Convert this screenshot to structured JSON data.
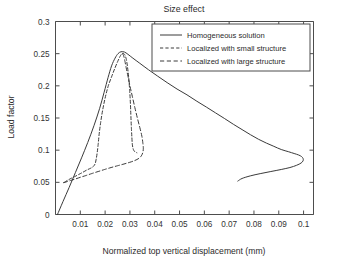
{
  "chart_data": {
    "type": "line",
    "title": "Size effect",
    "xlabel": "Normalized top vertical displacement (mm)",
    "ylabel": "Load factor",
    "xlim": [
      0,
      0.104
    ],
    "ylim": [
      0,
      0.3
    ],
    "grid": false,
    "legend_position": "upper-right-inside",
    "xticks": [
      0.01,
      0.02,
      0.03,
      0.04,
      0.05,
      0.06,
      0.07,
      0.08,
      0.09,
      0.1
    ],
    "xticklabels": [
      "0.01",
      "0.02",
      "0.03",
      "0.04",
      "0.05",
      "0.06",
      "0.07",
      "0.08",
      "0.09",
      "0.1"
    ],
    "yticks": [
      0,
      0.05,
      0.1,
      0.15,
      0.2,
      0.25,
      0.3
    ],
    "yticklabels": [
      "0",
      "0.05",
      "0.1",
      "0.15",
      "0.2",
      "0.25",
      "0.3"
    ],
    "series": [
      {
        "name": "Homogeneous solution",
        "style": "solid",
        "points": [
          [
            0.0008,
            0.0
          ],
          [
            0.003,
            0.02
          ],
          [
            0.0055,
            0.042
          ],
          [
            0.008,
            0.065
          ],
          [
            0.0105,
            0.088
          ],
          [
            0.013,
            0.112
          ],
          [
            0.0155,
            0.138
          ],
          [
            0.0178,
            0.165
          ],
          [
            0.0196,
            0.19
          ],
          [
            0.0212,
            0.213
          ],
          [
            0.0226,
            0.231
          ],
          [
            0.024,
            0.243
          ],
          [
            0.0252,
            0.25
          ],
          [
            0.0264,
            0.253
          ],
          [
            0.0278,
            0.2525
          ],
          [
            0.0292,
            0.249
          ],
          [
            0.0312,
            0.243
          ],
          [
            0.034,
            0.235
          ],
          [
            0.0375,
            0.225
          ],
          [
            0.0412,
            0.215
          ],
          [
            0.045,
            0.205
          ],
          [
            0.049,
            0.195
          ],
          [
            0.053,
            0.186
          ],
          [
            0.057,
            0.176
          ],
          [
            0.0608,
            0.167
          ],
          [
            0.0645,
            0.158
          ],
          [
            0.0682,
            0.149
          ],
          [
            0.0718,
            0.14
          ],
          [
            0.0752,
            0.132
          ],
          [
            0.0786,
            0.124
          ],
          [
            0.0818,
            0.117
          ],
          [
            0.085,
            0.111
          ],
          [
            0.088,
            0.106
          ],
          [
            0.091,
            0.101
          ],
          [
            0.094,
            0.0975
          ],
          [
            0.0962,
            0.0948
          ],
          [
            0.098,
            0.0925
          ],
          [
            0.0992,
            0.09
          ],
          [
            0.0998,
            0.087
          ],
          [
            0.0998,
            0.0835
          ],
          [
            0.099,
            0.08
          ],
          [
            0.0972,
            0.0765
          ],
          [
            0.0945,
            0.073
          ],
          [
            0.091,
            0.07
          ],
          [
            0.0868,
            0.0668
          ],
          [
            0.0825,
            0.0635
          ],
          [
            0.0785,
            0.06
          ],
          [
            0.0752,
            0.056
          ],
          [
            0.0735,
            0.052
          ]
        ]
      },
      {
        "name": "Localized with small structure",
        "style": "dashed",
        "points": [
          [
            0.0036,
            0.05
          ],
          [
            0.0048,
            0.053
          ],
          [
            0.0062,
            0.056
          ],
          [
            0.0078,
            0.059
          ],
          [
            0.0095,
            0.0625
          ],
          [
            0.0112,
            0.066
          ],
          [
            0.0128,
            0.0695
          ],
          [
            0.0142,
            0.072
          ],
          [
            0.0152,
            0.0745
          ],
          [
            0.016,
            0.079
          ],
          [
            0.0164,
            0.086
          ],
          [
            0.0168,
            0.096
          ],
          [
            0.0172,
            0.109
          ],
          [
            0.0176,
            0.125
          ],
          [
            0.0182,
            0.143
          ],
          [
            0.019,
            0.162
          ],
          [
            0.02,
            0.181
          ],
          [
            0.0212,
            0.199
          ],
          [
            0.0226,
            0.214
          ],
          [
            0.024,
            0.228
          ],
          [
            0.0252,
            0.239
          ],
          [
            0.0262,
            0.247
          ],
          [
            0.027,
            0.2505
          ],
          [
            0.0278,
            0.249
          ],
          [
            0.0285,
            0.242
          ],
          [
            0.029,
            0.23
          ],
          [
            0.0295,
            0.213
          ],
          [
            0.0299,
            0.193
          ],
          [
            0.0302,
            0.172
          ],
          [
            0.0304,
            0.152
          ],
          [
            0.0306,
            0.134
          ],
          [
            0.0308,
            0.119
          ],
          [
            0.031,
            0.108
          ],
          [
            0.0314,
            0.101
          ],
          [
            0.032,
            0.0975
          ],
          [
            0.0328,
            0.096
          ]
        ]
      },
      {
        "name": "Localized with large structure",
        "style": "dashed",
        "points": [
          [
            0.0032,
            0.0495
          ],
          [
            0.0046,
            0.051
          ],
          [
            0.0062,
            0.053
          ],
          [
            0.008,
            0.0552
          ],
          [
            0.01,
            0.0578
          ],
          [
            0.0122,
            0.0605
          ],
          [
            0.0146,
            0.0636
          ],
          [
            0.0172,
            0.0668
          ],
          [
            0.0198,
            0.07
          ],
          [
            0.0224,
            0.073
          ],
          [
            0.025,
            0.0758
          ],
          [
            0.0276,
            0.0785
          ],
          [
            0.03,
            0.0812
          ],
          [
            0.032,
            0.084
          ],
          [
            0.0336,
            0.0872
          ],
          [
            0.0346,
            0.0912
          ],
          [
            0.0352,
            0.0965
          ],
          [
            0.0354,
            0.103
          ],
          [
            0.0352,
            0.1115
          ],
          [
            0.0348,
            0.122
          ],
          [
            0.034,
            0.135
          ],
          [
            0.033,
            0.15
          ],
          [
            0.032,
            0.166
          ],
          [
            0.031,
            0.183
          ],
          [
            0.03,
            0.2
          ],
          [
            0.0292,
            0.215
          ],
          [
            0.0285,
            0.228
          ],
          [
            0.028,
            0.238
          ],
          [
            0.0276,
            0.245
          ],
          [
            0.0272,
            0.249
          ],
          [
            0.0268,
            0.2505
          ]
        ]
      }
    ]
  },
  "legend": {
    "entries": [
      {
        "label": "Homogeneous solution",
        "style": "solid"
      },
      {
        "label": "Localized with small structure",
        "style": "dashed"
      },
      {
        "label": "Localized with large structure",
        "style": "dashed"
      }
    ]
  }
}
